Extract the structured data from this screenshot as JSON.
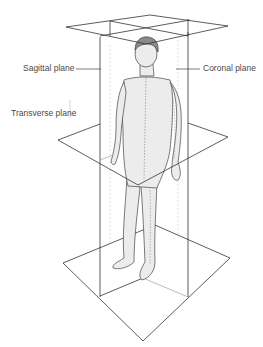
{
  "diagram": {
    "type": "anatomical-planes",
    "labels": {
      "sagittal": "Sagittal plane",
      "coronal": "Coronal plane",
      "transverse": "Transverse plane"
    },
    "colors": {
      "line": "#333333",
      "skin": "#ececec",
      "hair": "#8a8a8a",
      "text": "#4a4a4a"
    }
  }
}
